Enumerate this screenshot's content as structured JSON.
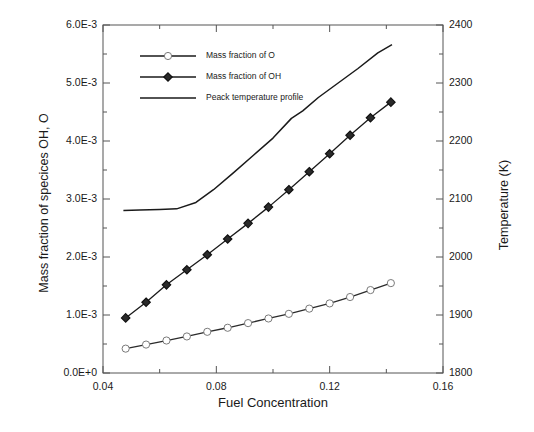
{
  "chart_data": {
    "type": "line",
    "title": "",
    "xlabel": "Fuel Concentration",
    "ylabel": "Mass fraction of specices OH, O",
    "y2label": "Temperature (K)",
    "xlim": [
      0.04,
      0.16
    ],
    "ylim": [
      0.0,
      0.006
    ],
    "y2lim": [
      1800,
      2400
    ],
    "grid": false,
    "legend_position": "top-left-inside",
    "xticks": [
      "0.04",
      "0.08",
      "0.12",
      "0.16"
    ],
    "xtick_values": [
      0.04,
      0.08,
      0.12,
      0.16
    ],
    "xminor_values": [
      0.06,
      0.1,
      0.14
    ],
    "yticks": [
      "0.0E+0",
      "1.0E-3",
      "2.0E-3",
      "3.0E-3",
      "4.0E-3",
      "5.0E-3",
      "6.0E-3"
    ],
    "ytick_values": [
      0.0,
      0.001,
      0.002,
      0.003,
      0.004,
      0.005,
      0.006
    ],
    "yminor_values": [
      0.0005,
      0.0015,
      0.0025,
      0.0035,
      0.0045,
      0.0055
    ],
    "y2ticks": [
      "1800",
      "1900",
      "2000",
      "2100",
      "2200",
      "2300",
      "2400"
    ],
    "y2tick_values": [
      1800,
      1900,
      2000,
      2100,
      2200,
      2300,
      2400
    ],
    "y2minor_values": [
      1850,
      1950,
      2050,
      2150,
      2250,
      2350
    ],
    "series": [
      {
        "name": "Mass fraction of O",
        "axis": "left",
        "marker": "circle",
        "color": "#2b2b2b",
        "x": [
          0.048,
          0.0552,
          0.0624,
          0.0696,
          0.0768,
          0.084,
          0.0912,
          0.0984,
          0.1056,
          0.1128,
          0.12,
          0.1272,
          0.1344,
          0.1416
        ],
        "values": [
          0.00042,
          0.00049,
          0.00056,
          0.00063,
          0.00071,
          0.00078,
          0.00086,
          0.00094,
          0.00102,
          0.00111,
          0.0012,
          0.00131,
          0.00143,
          0.00155
        ]
      },
      {
        "name": "Mass fraction of OH",
        "axis": "left",
        "marker": "diamond",
        "color": "#1a1a1a",
        "x": [
          0.048,
          0.0552,
          0.0624,
          0.0696,
          0.0768,
          0.084,
          0.0912,
          0.0984,
          0.1056,
          0.1128,
          0.12,
          0.1272,
          0.1344,
          0.1416
        ],
        "values": [
          0.00095,
          0.00122,
          0.00152,
          0.00178,
          0.00204,
          0.00231,
          0.00258,
          0.00286,
          0.00316,
          0.00347,
          0.00378,
          0.0041,
          0.0044,
          0.00467
        ]
      },
      {
        "name": "Peack temperature profile",
        "axis": "right",
        "marker": "none",
        "color": "#1a1a1a",
        "x": [
          0.0472,
          0.053,
          0.06,
          0.066,
          0.0728,
          0.079,
          0.086,
          0.093,
          0.1,
          0.1065,
          0.1105,
          0.116,
          0.123,
          0.13,
          0.137,
          0.142
        ],
        "values": [
          2080,
          2081,
          2082,
          2083,
          2094,
          2116,
          2145,
          2175,
          2205,
          2239,
          2252,
          2275,
          2300,
          2325,
          2352,
          2366
        ]
      }
    ]
  },
  "legend": {
    "entries": [
      {
        "label": "Mass fraction of O",
        "marker": "circle"
      },
      {
        "label": "Mass fraction of OH",
        "marker": "diamond"
      },
      {
        "label": "Peack temperature profile",
        "marker": "none"
      }
    ]
  }
}
